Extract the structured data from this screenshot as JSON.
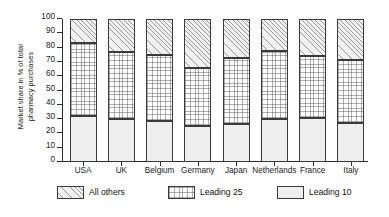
{
  "chart_data": {
    "type": "bar",
    "subtype": "stacked-bar",
    "title": "",
    "xlabel": "",
    "ylabel": "Market share in % of total pharmacy purchases",
    "ylabel_lines": [
      "Market share in % of total",
      "pharmacy purchases"
    ],
    "ylim": [
      0,
      100
    ],
    "yticks": [
      0,
      10,
      20,
      30,
      40,
      50,
      60,
      70,
      80,
      90,
      100
    ],
    "grid": false,
    "legend_position": "bottom",
    "categories": [
      "USA",
      "UK",
      "Belgium",
      "Germany",
      "Japan",
      "Netherlands",
      "France",
      "Italy"
    ],
    "series": [
      {
        "name": "Leading 10",
        "pattern": "solid-light",
        "values": [
          32,
          30,
          28.5,
          25.5,
          26.5,
          30,
          30.5,
          27.5
        ]
      },
      {
        "name": "Leading 25",
        "pattern": "dotted",
        "values": [
          51,
          47,
          46.5,
          40.5,
          46,
          47.5,
          43.5,
          43.5
        ]
      },
      {
        "name": "All others",
        "pattern": "diagonal-hatch",
        "values": [
          17,
          23,
          25,
          34,
          27.5,
          22.5,
          26,
          29
        ]
      }
    ],
    "cumulative_tops": {
      "Leading 10": [
        32,
        30,
        28.5,
        25.5,
        26.5,
        30,
        30.5,
        27.5
      ],
      "Leading 25": [
        83,
        77,
        75,
        66,
        72.5,
        77.5,
        74,
        71
      ],
      "All others": [
        100,
        100,
        100,
        100,
        100,
        100,
        100,
        100
      ]
    },
    "colors": {
      "leading_10": "#eeeeee",
      "leading_25": "#fdfdfd",
      "all_others": "#f1f1f1",
      "outline": "#3a3a3a",
      "axis": "#2b2b2b",
      "text": "#111111",
      "background": "#ffffff"
    }
  },
  "legend": {
    "items": [
      {
        "label": "All others",
        "key": "all_others"
      },
      {
        "label": "Leading 25",
        "key": "leading_25"
      },
      {
        "label": "Leading 10",
        "key": "leading_10"
      }
    ]
  }
}
